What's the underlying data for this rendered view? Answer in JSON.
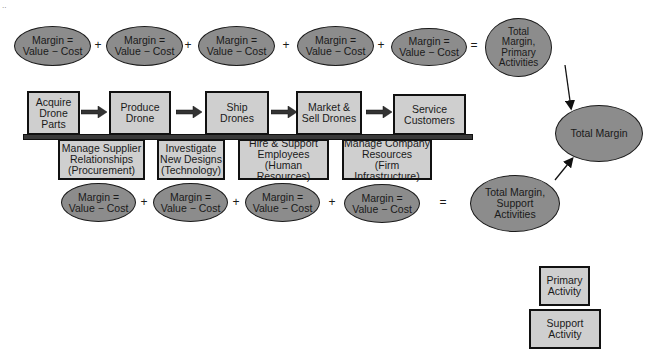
{
  "primary_margins": [
    {
      "label": "Margin =\nValue − Cost"
    },
    {
      "label": "Margin =\nValue − Cost"
    },
    {
      "label": "Margin =\nValue − Cost"
    },
    {
      "label": "Margin =\nValue − Cost"
    },
    {
      "label": "Margin =\nValue − Cost"
    }
  ],
  "support_margins": [
    {
      "label": "Margin =\nValue − Cost"
    },
    {
      "label": "Margin =\nValue − Cost"
    },
    {
      "label": "Margin =\nValue − Cost"
    },
    {
      "label": "Margin =\nValue − Cost"
    }
  ],
  "operators": {
    "plus": "+",
    "equals": "="
  },
  "primary_activities": [
    {
      "label": "Acquire\nDrone\nParts"
    },
    {
      "label": "Produce\nDrone"
    },
    {
      "label": "Ship\nDrones"
    },
    {
      "label": "Market &\nSell Drones"
    },
    {
      "label": "Service\nCustomers"
    }
  ],
  "support_activities": [
    {
      "label": "Manage Supplier\nRelationships\n(Procurement)"
    },
    {
      "label": "Investigate\nNew Designs\n(Technology)"
    },
    {
      "label": "Hire & Support\nEmployees\n(Human Resources)"
    },
    {
      "label": "Manage Company\nResources\n(Firm Infrastructure)"
    }
  ],
  "totals": {
    "primary": "Total\nMargin,\nPrimary\nActivities",
    "support": "Total Margin,\nSupport\nActivities",
    "overall": "Total Margin"
  },
  "legend": {
    "primary": "Primary\nActivity",
    "support": "Support\nActivity"
  },
  "colors": {
    "ellipse_fill": "#8c8c8c",
    "box_fill": "#cfcfcf",
    "outline": "#111111"
  }
}
